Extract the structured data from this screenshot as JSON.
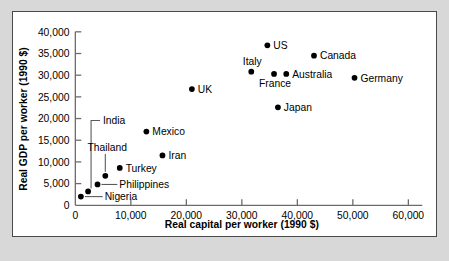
{
  "figure": {
    "background_color": "#ffffff",
    "page_background_color": "#d8d8d8",
    "border_color": "#4a4a4a",
    "marker_color": "#000000",
    "axis_color": "#6b6b6b"
  },
  "chart_data": {
    "type": "scatter",
    "title": "",
    "xlabel": "Real capital per worker (1990 $)",
    "ylabel": "Real GDP per worker (1990 $)",
    "xlim": [
      0,
      62000
    ],
    "ylim": [
      0,
      41500
    ],
    "xticks": [
      0,
      10000,
      20000,
      30000,
      40000,
      50000,
      60000
    ],
    "yticks": [
      0,
      5000,
      10000,
      15000,
      20000,
      25000,
      30000,
      35000,
      40000
    ],
    "xticklabels": [
      "0",
      "10,000",
      "20,000",
      "30,000",
      "40,000",
      "50,000",
      "60,000"
    ],
    "yticklabels": [
      "0",
      "5,000",
      "10,000",
      "15,000",
      "20,000",
      "25,000",
      "30,000",
      "35,000",
      "40,000"
    ],
    "grid": false,
    "legend": false,
    "points": [
      {
        "name": "Nigeria",
        "x": 1000,
        "y": 2000,
        "label_pos": "leader-right"
      },
      {
        "name": "India",
        "x": 2300,
        "y": 3200,
        "label_pos": "leader-bracket"
      },
      {
        "name": "Philippines",
        "x": 4000,
        "y": 4800,
        "label_pos": "leader-right"
      },
      {
        "name": "Thailand",
        "x": 5400,
        "y": 6800,
        "label_pos": "leader-up"
      },
      {
        "name": "Turkey",
        "x": 8000,
        "y": 8600,
        "label_pos": "right"
      },
      {
        "name": "Mexico",
        "x": 12800,
        "y": 17000,
        "label_pos": "right"
      },
      {
        "name": "Iran",
        "x": 15700,
        "y": 11500,
        "label_pos": "right"
      },
      {
        "name": "UK",
        "x": 21000,
        "y": 26800,
        "label_pos": "right"
      },
      {
        "name": "Italy",
        "x": 31700,
        "y": 30800,
        "label_pos": "above-left"
      },
      {
        "name": "US",
        "x": 34600,
        "y": 36900,
        "label_pos": "right"
      },
      {
        "name": "France",
        "x": 35800,
        "y": 30300,
        "label_pos": "below-left"
      },
      {
        "name": "Japan",
        "x": 36500,
        "y": 22600,
        "label_pos": "right"
      },
      {
        "name": "Australia",
        "x": 38000,
        "y": 30300,
        "label_pos": "right"
      },
      {
        "name": "Canada",
        "x": 43000,
        "y": 34500,
        "label_pos": "right"
      },
      {
        "name": "Germany",
        "x": 50300,
        "y": 29400,
        "label_pos": "right"
      }
    ]
  },
  "caption": {
    "text": "clipped page text below figure"
  }
}
